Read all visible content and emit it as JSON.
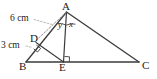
{
  "figure": {
    "background_color": "#ffffff",
    "stroke_color": "#3b3b3b",
    "dash_color": "#8a8a8a",
    "text_color": "#1b1b1b",
    "width": 157,
    "height": 79
  },
  "vertices": [
    {
      "id": "A",
      "label": "A",
      "x": 66.5,
      "y": 12.0,
      "name": "vertex-a"
    },
    {
      "id": "B",
      "label": "B",
      "x": 26.0,
      "y": 62.0,
      "name": "vertex-b"
    },
    {
      "id": "C",
      "label": "C",
      "x": 139.0,
      "y": 62.0,
      "name": "vertex-c"
    },
    {
      "id": "D",
      "label": "D",
      "x": 36.0,
      "y": 42.5,
      "name": "point-d"
    },
    {
      "id": "E",
      "label": "E",
      "x": 63.5,
      "y": 62.0,
      "name": "point-e"
    }
  ],
  "segments": [
    {
      "id": "AB",
      "from": "A",
      "to": "B",
      "style": "solid",
      "name": "segment-ab"
    },
    {
      "id": "BC",
      "from": "B",
      "to": "C",
      "style": "solid",
      "name": "segment-bc"
    },
    {
      "id": "AC",
      "from": "A",
      "to": "C",
      "style": "solid",
      "name": "segment-ac"
    },
    {
      "id": "AE",
      "from": "A",
      "to": "E",
      "style": "solid",
      "name": "segment-ae-altitude"
    },
    {
      "id": "DE",
      "from": "D",
      "to": "E",
      "style": "solid",
      "name": "segment-de"
    },
    {
      "id": "AD",
      "from": "A",
      "to": "D",
      "style": "dashed",
      "name": "segment-ad-dashed"
    }
  ],
  "measures": [
    {
      "id": "AD",
      "label": "6 cm",
      "value": 6,
      "unit": "cm",
      "applies_to": "AD",
      "name": "measure-ad-6cm"
    },
    {
      "id": "DB",
      "label": "3 cm",
      "value": 3,
      "unit": "cm",
      "applies_to": "DB",
      "name": "measure-db-3cm"
    }
  ],
  "angles": [
    {
      "id": "y",
      "label": "y",
      "at": "A",
      "between": "AD and AE",
      "name": "angle-y-label"
    },
    {
      "id": "x",
      "label": "x",
      "at": "A",
      "between": "AE and AC",
      "name": "angle-x-label"
    }
  ],
  "right_angles": [
    {
      "id": "at-E",
      "at": "E",
      "description": "AE perpendicular to BC",
      "name": "right-angle-mark-e"
    },
    {
      "id": "at-D",
      "at": "D",
      "description": "DE perpendicular to AB",
      "name": "right-angle-mark-d"
    }
  ]
}
